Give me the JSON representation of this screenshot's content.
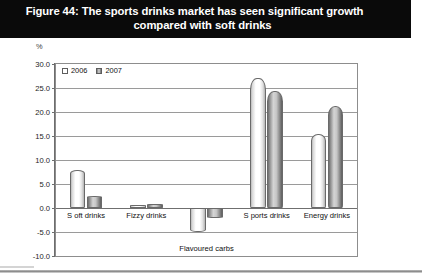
{
  "figure": {
    "title_line1": "Figure 44: The sports drinks market has seen significant growth",
    "title_line2": "compared with soft drinks",
    "unit_label": "%"
  },
  "chart_data": {
    "type": "bar",
    "title": "Figure 44: The sports drinks market has seen significant growth compared with soft drinks",
    "xlabel": "",
    "ylabel": "Year on year % value growth",
    "unit": "%",
    "categories": [
      "S oft drinks",
      "Fizzy drinks",
      "Flavoured carbs",
      "S ports drinks",
      "Energy drinks"
    ],
    "series": [
      {
        "name": "2006",
        "values": [
          8.0,
          0.7,
          -5.0,
          27.0,
          15.4
        ]
      },
      {
        "name": "2007",
        "values": [
          2.5,
          0.9,
          -2.0,
          24.4,
          21.3
        ]
      }
    ],
    "ylim": [
      -10.0,
      30.0
    ],
    "ytick_step": 5.0,
    "ytick_labels": [
      "30.0",
      "25.0",
      "20.0",
      "15.0",
      "10.0",
      "5.0",
      "0.0",
      "-5.0",
      "-10.0"
    ],
    "ytick_values": [
      30.0,
      25.0,
      20.0,
      15.0,
      10.0,
      5.0,
      0.0,
      -5.0,
      -10.0
    ],
    "grid": true,
    "legend_position": "top-left",
    "colors": {
      "series_2006": "#ffffff",
      "series_2007": "#9a9a9a",
      "title_bar": "#0a0a0a",
      "axis": "#6d6d6d",
      "grid": "#9a9a9a"
    }
  },
  "legend": {
    "items": [
      {
        "label": "2006"
      },
      {
        "label": "2007"
      }
    ]
  }
}
